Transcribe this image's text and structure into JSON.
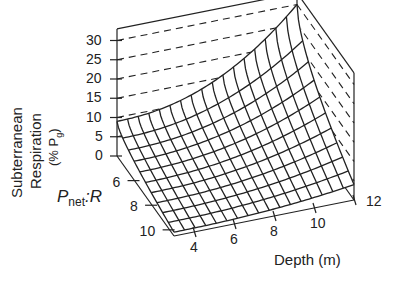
{
  "chart_data": {
    "type": "surface3d",
    "title": "",
    "zlabel_line1": "Subterranean",
    "zlabel_line2": "Respiration",
    "zlabel_line3": "(% P",
    "zlabel_sub": "g",
    "zlabel_close": ")",
    "xlabel": "Depth (m)",
    "ylabel_main": "P",
    "ylabel_sub": "net",
    "ylabel_tail": ":R",
    "z_ticks": [
      "30",
      "25",
      "20",
      "15",
      "10",
      "5",
      "0"
    ],
    "z_range": [
      0,
      33
    ],
    "x_ticks": [
      "4",
      "6",
      "8",
      "10",
      "12"
    ],
    "x_range": [
      3,
      12
    ],
    "y_ticks": [
      "6",
      "8",
      "10"
    ],
    "y_range": [
      4,
      10.5
    ],
    "gridlines": "dashed on back walls",
    "surface_description": "Respiration rises steeply with depth and with lower Pnet:R; peak ~30% at depth 12 m and Pnet:R 4; ~9% at depth 3 m, Pnet:R 4; near 0–3% at high Pnet:R, shallow depth",
    "depth_values": [
      3,
      4,
      5,
      6,
      7,
      8,
      9,
      10,
      11,
      12
    ],
    "pnet_r_values": [
      4,
      5,
      6,
      7,
      8,
      9,
      10
    ],
    "z_corner_values": {
      "depth3_pr4": 9,
      "depth12_pr4": 30,
      "depth3_pr10": 1,
      "depth12_pr10": 4
    }
  },
  "caption_fragment": "Fig. 4.3"
}
